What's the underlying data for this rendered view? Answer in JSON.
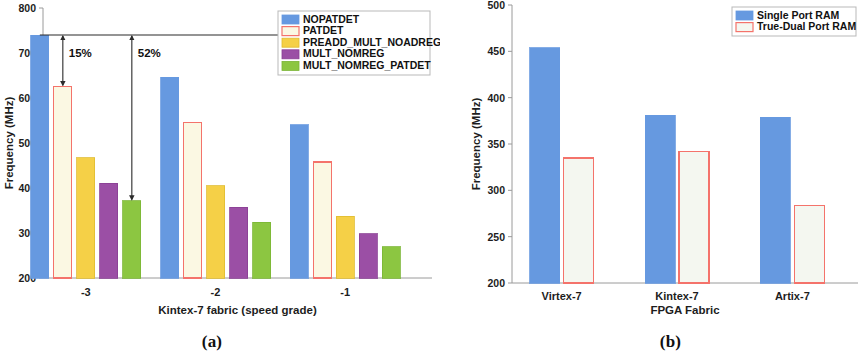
{
  "figure": {
    "subfigures": [
      {
        "key": "a",
        "caption": "(a)"
      },
      {
        "key": "b",
        "caption": "(b)"
      }
    ]
  },
  "chart_data": [
    {
      "id": "chart-a",
      "type": "bar",
      "title": "",
      "xlabel": "Kintex-7 fabric (speed grade)",
      "ylabel": "Frequency (MHz)",
      "categories": [
        "-3",
        "-2",
        "-1"
      ],
      "ylim": [
        200,
        800
      ],
      "yticks": [
        200,
        300,
        400,
        500,
        600,
        700,
        800
      ],
      "ytick_labels": [
        "200",
        "300",
        "400",
        "500",
        "600",
        "700",
        "800"
      ],
      "grid": false,
      "legend_position": "top-right",
      "series": [
        {
          "name": "NOPATDET",
          "values": [
            740,
            646,
            541
          ],
          "color": "#6699e0",
          "edge": "#6699e0",
          "filled": true
        },
        {
          "name": "PATDET",
          "values": [
            626,
            545,
            458
          ],
          "color": "#fbf8e3",
          "edge": "#f4736b",
          "filled": false
        },
        {
          "name": "PREADD_MULT_NOADREG",
          "values": [
            467,
            405,
            337
          ],
          "color": "#f5d047",
          "edge": "#e0bb2f",
          "filled": true
        },
        {
          "name": "MULT_NOMREG",
          "values": [
            411,
            357,
            298
          ],
          "color": "#9b4fa5",
          "edge": "#8a3f94",
          "filled": true
        },
        {
          "name": "MULT_NOMREG_PATDET",
          "values": [
            372,
            324,
            270
          ],
          "color": "#8cc641",
          "edge": "#7ab535",
          "filled": true
        }
      ],
      "annotations": [
        {
          "label": "15%",
          "from_series": "NOPATDET",
          "to_series": "PATDET",
          "group": "-3"
        },
        {
          "label": "52%",
          "from_series": "NOPATDET",
          "to_series": "MULT_NOMREG_PATDET",
          "group": "-3"
        }
      ]
    },
    {
      "id": "chart-b",
      "type": "bar",
      "title": "",
      "xlabel": "FPGA Fabric",
      "ylabel": "Frequency (MHz)",
      "categories": [
        "Virtex-7",
        "Kintex-7",
        "Artix-7"
      ],
      "ylim": [
        200,
        500
      ],
      "yticks": [
        200,
        250,
        300,
        350,
        400,
        450,
        500
      ],
      "ytick_labels": [
        "200",
        "250",
        "300",
        "350",
        "400",
        "450",
        "500"
      ],
      "grid": false,
      "legend_position": "top-right",
      "series": [
        {
          "name": "Single Port RAM",
          "values": [
            454,
            381,
            379
          ],
          "color": "#6699e0",
          "edge": "#6699e0",
          "filled": true
        },
        {
          "name": "True-Dual Port RAM",
          "values": [
            335,
            342,
            284
          ],
          "color": "#f4f7f0",
          "edge": "#f4736b",
          "filled": false
        }
      ],
      "annotations": []
    }
  ]
}
